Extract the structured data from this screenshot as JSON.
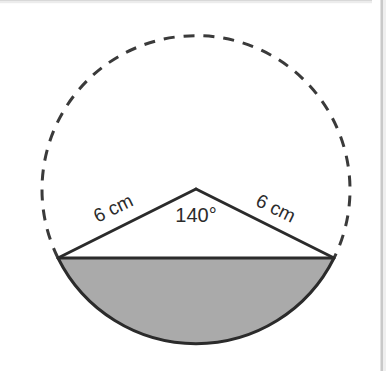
{
  "figure": {
    "background_color": "#ffffff",
    "border_color": "#c9c9c9"
  },
  "geometry": {
    "circle": {
      "center_x": 196,
      "center_y": 191,
      "radius": 154,
      "arc_style": "dashed",
      "stroke_color": "#3a3a3a",
      "stroke_width": 3,
      "dash_pattern": "11 9"
    },
    "sector": {
      "angle_degrees": 140,
      "radius_cm": 6,
      "apex_x": 196,
      "apex_y": 189,
      "left_point_x": 58,
      "left_point_y": 258,
      "right_point_x": 334,
      "right_point_y": 258
    },
    "shaded_region": {
      "name": "minor-segment",
      "fill_color": "#aaaaaa",
      "stroke_color": "#2b2b2b",
      "stroke_width": 3
    }
  },
  "labels": {
    "left_radius": {
      "text": "6 cm",
      "x": 116,
      "y": 214,
      "rotation_degrees": -26
    },
    "right_radius": {
      "text": "6 cm",
      "x": 273,
      "y": 214,
      "rotation_degrees": 26
    },
    "angle": {
      "text": "140°",
      "x": 196,
      "y": 222
    }
  }
}
